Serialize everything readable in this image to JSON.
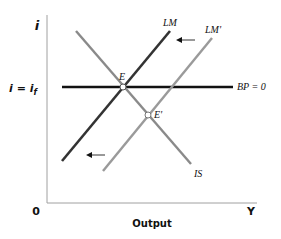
{
  "diagram": {
    "title": "",
    "y_axis_label": "i",
    "x_axis_label": "Output",
    "x_axis_end_label": "Y",
    "origin_label": "0",
    "world_rate_label_left": "i = i",
    "world_rate_label_sub": "f",
    "curves": {
      "lm": {
        "label": "LM",
        "color": "#333333"
      },
      "lm_prime": {
        "label": "LM'",
        "color": "#9a9a9a"
      },
      "is": {
        "label": "IS",
        "color": "#8a8a8a"
      },
      "bp": {
        "label": "BP = 0",
        "color": "#111111"
      }
    },
    "points": {
      "e": {
        "label": "E"
      },
      "e_prime": {
        "label": "E'"
      }
    },
    "arrows": [
      {
        "name": "lm-shift-arrow-top",
        "direction": "left"
      },
      {
        "name": "lm-shift-arrow-bottom",
        "direction": "left"
      }
    ],
    "colors": {
      "axis": "#999999",
      "background": "#ffffff"
    }
  }
}
